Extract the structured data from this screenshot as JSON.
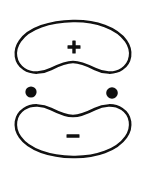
{
  "figure": {
    "title": "Two-lobe charge distribution diagram",
    "background_color": "#ffffff",
    "stroke_color": "#111111",
    "fill_color": "#0d0d0d",
    "width": 147,
    "height": 178
  },
  "lobes": [
    {
      "id": "upper-lobe",
      "name": "upper-lobe",
      "sign_label": "+",
      "sign_name": "plus-sign",
      "position": "top",
      "concave_edge": "bottom",
      "sign_center": {
        "x": 74,
        "y": 47
      }
    },
    {
      "id": "lower-lobe",
      "name": "lower-lobe",
      "sign_label": "−",
      "sign_name": "minus-sign",
      "position": "bottom",
      "concave_edge": "top",
      "sign_center": {
        "x": 73,
        "y": 136
      }
    }
  ],
  "nuclei": [
    {
      "id": "left-nucleus",
      "name": "left-nucleus-dot",
      "cx": 31,
      "cy": 92,
      "r": 5.6
    },
    {
      "id": "right-nucleus",
      "name": "right-nucleus-dot",
      "cx": 112,
      "cy": 93,
      "r": 5.8
    }
  ],
  "signs": {
    "plus": {
      "label": "+",
      "arm_length": 13,
      "arm_thickness": 3.4
    },
    "minus": {
      "label": "−",
      "bar_width": 13,
      "bar_thickness": 3.6
    }
  }
}
